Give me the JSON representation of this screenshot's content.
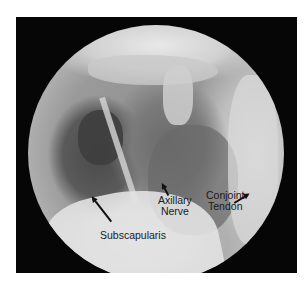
{
  "image": {
    "description": "Arthroscopic circular view of shoulder anatomy",
    "background_color": "#060606"
  },
  "labels": {
    "subscapularis": "Subscapularis",
    "axillary_nerve_line1": "Axillary",
    "axillary_nerve_line2": "Nerve",
    "conjoint_tendon_line1": "Conjoint",
    "conjoint_tendon_line2": "Tendon"
  }
}
